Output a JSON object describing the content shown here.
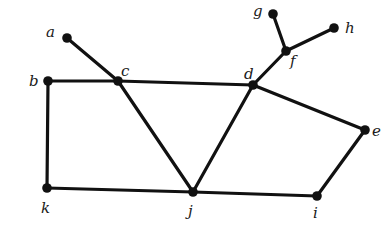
{
  "graph": {
    "type": "undirected",
    "style": {
      "edge_color": "#111111",
      "node_color": "#111111",
      "background": "#ffffff"
    },
    "nodes": [
      {
        "id": "a",
        "label": "a",
        "x": 67,
        "y": 38,
        "lx": 46,
        "ly": 37
      },
      {
        "id": "b",
        "label": "b",
        "x": 48,
        "y": 81,
        "lx": 29,
        "ly": 86
      },
      {
        "id": "c",
        "label": "c",
        "x": 118,
        "y": 81,
        "lx": 121,
        "ly": 76
      },
      {
        "id": "d",
        "label": "d",
        "x": 253,
        "y": 85,
        "lx": 244,
        "ly": 79
      },
      {
        "id": "e",
        "label": "e",
        "x": 365,
        "y": 130,
        "lx": 372,
        "ly": 136
      },
      {
        "id": "f",
        "label": "f",
        "x": 286,
        "y": 51,
        "lx": 290,
        "ly": 66
      },
      {
        "id": "g",
        "label": "g",
        "x": 273,
        "y": 14,
        "lx": 253,
        "ly": 16
      },
      {
        "id": "h",
        "label": "h",
        "x": 334,
        "y": 28,
        "lx": 345,
        "ly": 33
      },
      {
        "id": "i",
        "label": "i",
        "x": 317,
        "y": 196,
        "lx": 313,
        "ly": 218
      },
      {
        "id": "j",
        "label": "j",
        "x": 193,
        "y": 192,
        "lx": 188,
        "ly": 216
      },
      {
        "id": "k",
        "label": "k",
        "x": 47,
        "y": 188,
        "lx": 41,
        "ly": 213
      }
    ],
    "edges": [
      [
        "a",
        "c"
      ],
      [
        "b",
        "c"
      ],
      [
        "c",
        "d"
      ],
      [
        "b",
        "k"
      ],
      [
        "k",
        "j"
      ],
      [
        "c",
        "j"
      ],
      [
        "d",
        "j"
      ],
      [
        "j",
        "i"
      ],
      [
        "i",
        "e"
      ],
      [
        "e",
        "d"
      ],
      [
        "d",
        "f"
      ],
      [
        "f",
        "g"
      ],
      [
        "f",
        "h"
      ]
    ]
  }
}
